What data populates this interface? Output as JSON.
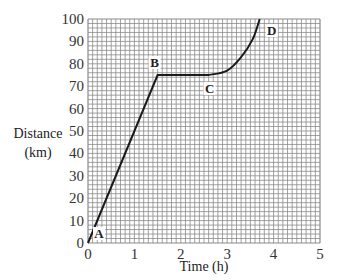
{
  "chart_data": {
    "type": "line",
    "title": "",
    "xlabel": "Time (h)",
    "ylabel": "Distance (km)",
    "ylabel_lines": [
      "Distance",
      "(km)"
    ],
    "xlim": [
      0,
      5
    ],
    "ylim": [
      0,
      100
    ],
    "grid": true,
    "grid_minor_x_step": 0.1,
    "grid_minor_y_step": 2,
    "x_ticks": [
      0,
      1,
      2,
      3,
      4,
      5
    ],
    "y_ticks": [
      0,
      10,
      20,
      30,
      40,
      50,
      60,
      70,
      80,
      90,
      100
    ],
    "series": [
      {
        "name": "Journey",
        "segments": [
          {
            "from": "A",
            "to": "B",
            "shape": "straight",
            "points": [
              [
                0,
                0
              ],
              [
                1.5,
                75
              ]
            ]
          },
          {
            "from": "B",
            "to": "C",
            "shape": "flat",
            "points": [
              [
                1.5,
                75
              ],
              [
                2.6,
                75
              ]
            ]
          },
          {
            "from": "C",
            "to": "D",
            "shape": "curve",
            "points": [
              [
                2.6,
                75
              ],
              [
                3.0,
                77
              ],
              [
                3.3,
                83
              ],
              [
                3.55,
                91
              ],
              [
                3.7,
                100
              ]
            ]
          }
        ]
      }
    ],
    "annotations": [
      {
        "label": "A",
        "x": 0,
        "y": 0
      },
      {
        "label": "B",
        "x": 1.5,
        "y": 75
      },
      {
        "label": "C",
        "x": 2.6,
        "y": 75
      },
      {
        "label": "D",
        "x": 3.7,
        "y": 100
      }
    ],
    "colors": {
      "line": "#1a1a1a",
      "grid": "#8a8a8a",
      "text": "#333333"
    }
  }
}
